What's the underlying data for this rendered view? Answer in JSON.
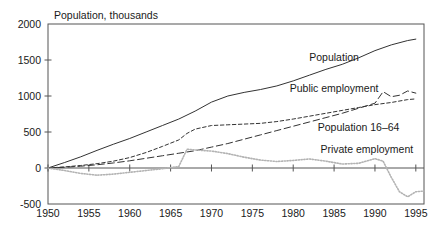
{
  "chart_data": {
    "type": "line",
    "title": "Population, thousands",
    "xlabel": "",
    "ylabel": "Population, thousands",
    "xlim": [
      1950,
      1996
    ],
    "ylim": [
      -500,
      2000
    ],
    "grid": false,
    "legend_position": "inline-annotations",
    "y_ticks": [
      2000,
      1500,
      1000,
      500,
      0,
      -500
    ],
    "y_tick_labels": [
      "2000",
      "1500",
      "1000",
      "500",
      "0",
      "-500"
    ],
    "x_ticks": [
      1950,
      1955,
      1960,
      1965,
      1970,
      1975,
      1980,
      1985,
      1990,
      1995
    ],
    "x_tick_labels": [
      "1950",
      "1955",
      "1960",
      "1965",
      "1970",
      "1975",
      "1980",
      "1985",
      "1990",
      "1995"
    ],
    "annotations": [
      {
        "name": "population",
        "text": "Population",
        "x": 1985,
        "y": 1480
      },
      {
        "name": "public-employment",
        "text": "Public employment",
        "x": 1985,
        "y": 1060
      },
      {
        "name": "population-16-64",
        "text": "Population 16–64",
        "x": 1988,
        "y": 520
      },
      {
        "name": "private-employment",
        "text": "Private employment",
        "x": 1989,
        "y": 215
      }
    ],
    "series": [
      {
        "name": "Population",
        "style": "solid",
        "color": "#333333",
        "x": [
          1950,
          1952,
          1954,
          1956,
          1958,
          1960,
          1962,
          1964,
          1966,
          1968,
          1970,
          1972,
          1974,
          1976,
          1978,
          1980,
          1982,
          1984,
          1986,
          1988,
          1990,
          1992,
          1994,
          1995
        ],
        "y": [
          0,
          75,
          155,
          245,
          330,
          410,
          500,
          590,
          680,
          790,
          915,
          1000,
          1050,
          1090,
          1140,
          1210,
          1290,
          1370,
          1440,
          1530,
          1630,
          1710,
          1770,
          1790
        ]
      },
      {
        "name": "Public employment",
        "style": "dashed",
        "color": "#333333",
        "x": [
          1950,
          1952,
          1954,
          1956,
          1958,
          1960,
          1962,
          1964,
          1966,
          1968,
          1970,
          1972,
          1974,
          1976,
          1978,
          1980,
          1982,
          1984,
          1986,
          1988,
          1990,
          1991,
          1992,
          1993,
          1994,
          1995
        ],
        "y": [
          0,
          10,
          25,
          45,
          70,
          100,
          135,
          170,
          205,
          240,
          290,
          340,
          400,
          460,
          520,
          580,
          640,
          700,
          760,
          830,
          900,
          1060,
          990,
          1010,
          1070,
          1040
        ]
      },
      {
        "name": "Population 16-64",
        "style": "fine-dashed",
        "color": "#333333",
        "x": [
          1950,
          1952,
          1954,
          1956,
          1958,
          1960,
          1962,
          1964,
          1966,
          1967,
          1968,
          1970,
          1972,
          1974,
          1976,
          1978,
          1980,
          1982,
          1984,
          1986,
          1988,
          1990,
          1992,
          1994,
          1995
        ],
        "y": [
          0,
          15,
          35,
          60,
          95,
          145,
          215,
          300,
          390,
          480,
          540,
          590,
          600,
          610,
          620,
          645,
          680,
          720,
          760,
          800,
          840,
          880,
          910,
          950,
          960
        ]
      },
      {
        "name": "Private employment",
        "style": "dotted",
        "color": "#b3b3b3",
        "x": [
          1950,
          1952,
          1954,
          1956,
          1958,
          1960,
          1962,
          1964,
          1966,
          1967,
          1968,
          1970,
          1972,
          1974,
          1976,
          1978,
          1980,
          1982,
          1984,
          1986,
          1988,
          1990,
          1991,
          1992,
          1993,
          1994,
          1995,
          1996
        ],
        "y": [
          0,
          -35,
          -75,
          -100,
          -85,
          -60,
          -35,
          -10,
          20,
          260,
          250,
          235,
          200,
          150,
          110,
          90,
          105,
          125,
          95,
          55,
          65,
          130,
          95,
          -130,
          -330,
          -400,
          -330,
          -320
        ]
      }
    ]
  },
  "geometry": {
    "plot_left": 48,
    "plot_right": 424,
    "plot_top": 24,
    "plot_bottom": 204
  }
}
